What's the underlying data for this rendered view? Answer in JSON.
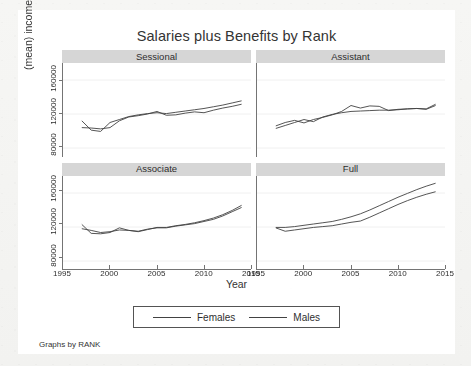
{
  "chart_data": {
    "type": "line",
    "title": "Salaries plus Benefits by Rank",
    "xlabel": "Year",
    "ylabel": "(mean) income",
    "footnote": "Graphs by RANK",
    "grid": true,
    "legend_position": "bottom",
    "xlim": [
      1995,
      2015
    ],
    "ylim": [
      70000,
      180000
    ],
    "xticks": [
      1995,
      2000,
      2005,
      2010,
      2015
    ],
    "yticks": [
      80000,
      120000,
      160000
    ],
    "xtick_labels": [
      "1995",
      "2000",
      "2005",
      "2010",
      "2015"
    ],
    "ytick_labels": [
      "80000",
      "120000",
      "160000"
    ],
    "legend": [
      "Females",
      "Males"
    ],
    "series_colors": [
      "#3a3a3a",
      "#3a3a3a"
    ],
    "panels": [
      {
        "name": "Sessional",
        "x": [
          1997,
          1998,
          1999,
          2000,
          2001,
          2002,
          2003,
          2004,
          2005,
          2006,
          2007,
          2008,
          2009,
          2010,
          2011,
          2012,
          2013,
          2014
        ],
        "series": [
          {
            "name": "Females",
            "values": [
              104000,
              103500,
              102500,
              104000,
              112000,
              116500,
              118000,
              120000,
              123000,
              118500,
              119000,
              121000,
              122500,
              121500,
              124500,
              127000,
              129000,
              131500
            ]
          },
          {
            "name": "Males",
            "values": [
              112000,
              101000,
              99500,
              110000,
              113500,
              117000,
              119000,
              120500,
              121500,
              120500,
              122000,
              123500,
              125000,
              126500,
              128500,
              130500,
              133000,
              135500
            ]
          }
        ]
      },
      {
        "name": "Assistant",
        "x": [
          1997,
          1998,
          1999,
          2000,
          2001,
          2002,
          2003,
          2004,
          2005,
          2006,
          2007,
          2008,
          2009,
          2010,
          2011,
          2012,
          2013,
          2014
        ],
        "series": [
          {
            "name": "Females",
            "values": [
              106000,
              110000,
              112500,
              109500,
              113500,
              116000,
              119000,
              123000,
              130000,
              127000,
              129500,
              129000,
              124000,
              125500,
              126000,
              126500,
              125500,
              130000
            ]
          },
          {
            "name": "Males",
            "values": [
              103000,
              106500,
              110000,
              113500,
              111000,
              116500,
              119500,
              121500,
              123000,
              123500,
              124000,
              124500,
              124500,
              125000,
              126000,
              126500,
              126000,
              131500
            ]
          }
        ]
      },
      {
        "name": "Associate",
        "x": [
          1997,
          1998,
          1999,
          2000,
          2001,
          2002,
          2003,
          2004,
          2005,
          2006,
          2007,
          2008,
          2009,
          2010,
          2011,
          2012,
          2013,
          2014
        ],
        "series": [
          {
            "name": "Females",
            "values": [
              123000,
              112500,
              112000,
              113500,
              119000,
              116000,
              115000,
              117500,
              119000,
              119000,
              121000,
              122500,
              124000,
              126500,
              129000,
              133000,
              138000,
              143000
            ]
          },
          {
            "name": "Males",
            "values": [
              118000,
              116000,
              113500,
              114500,
              116500,
              116000,
              114500,
              117000,
              119500,
              119500,
              121500,
              123000,
              125000,
              127500,
              130500,
              134500,
              139500,
              145500
            ]
          }
        ]
      },
      {
        "name": "Full",
        "x": [
          1997,
          1998,
          1999,
          2000,
          2001,
          2002,
          2003,
          2004,
          2005,
          2006,
          2007,
          2008,
          2009,
          2010,
          2011,
          2012,
          2013,
          2014
        ],
        "series": [
          {
            "name": "Females",
            "values": [
              119000,
              115000,
              116500,
              118000,
              119500,
              120500,
              121500,
              123500,
              125500,
              127000,
              131500,
              136500,
              141500,
              146500,
              151000,
              155000,
              158500,
              161500
            ]
          },
          {
            "name": "Males",
            "values": [
              119500,
              119500,
              120500,
              122000,
              123500,
              125000,
              126500,
              129000,
              132000,
              135500,
              140000,
              145000,
              150000,
              155000,
              159500,
              164000,
              168000,
              171500
            ]
          }
        ]
      }
    ]
  },
  "colors": {
    "panel_header_bg": "#d5d5d5",
    "axis": "#6e6e6e",
    "gridline": "#eaeaea",
    "line": "#3a3a3a",
    "text": "#1f1f1f",
    "page_bg": "#f2f2f0",
    "card_bg": "#ffffff"
  }
}
